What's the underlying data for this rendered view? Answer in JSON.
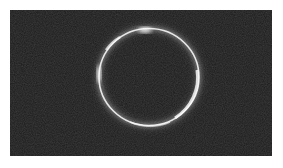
{
  "image": {
    "description": "Grayscale photo of a bright thin luminous ring on a dark noisy background",
    "alt": "Bright ring on dark background",
    "colors": {
      "background": "#ffffff",
      "photo_bg": "#1c1c1c",
      "ring": "#f4f4f4",
      "glow": "#bfbfbf"
    }
  }
}
